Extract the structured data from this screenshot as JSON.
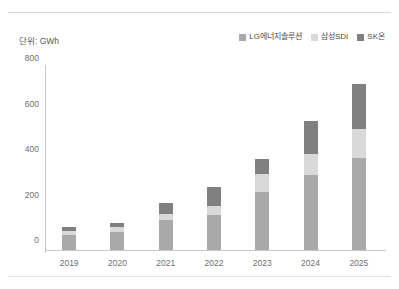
{
  "unit_label": "단위: GWh",
  "legend": {
    "position": "top-right",
    "items": [
      {
        "label": "LG에너지솔루션",
        "color": "#a9a9a9"
      },
      {
        "label": "삼성SDI",
        "color": "#d9d9d9"
      },
      {
        "label": "SK온",
        "color": "#808080"
      }
    ]
  },
  "axis": {
    "y_ticks": [
      "0",
      "200",
      "400",
      "600",
      "800"
    ],
    "x_ticks": [
      "2019",
      "2020",
      "2021",
      "2022",
      "2023",
      "2024",
      "2025"
    ]
  },
  "chart_data": {
    "type": "bar",
    "stacked": true,
    "title": "",
    "subtitle": "",
    "xlabel": "",
    "ylabel": "단위: GWh",
    "ylim": [
      0,
      800
    ],
    "y_ticks": [
      0,
      200,
      400,
      600,
      800
    ],
    "grid": false,
    "legend_position": "top-right",
    "categories": [
      "2019",
      "2020",
      "2021",
      "2022",
      "2023",
      "2024",
      "2025"
    ],
    "series": [
      {
        "name": "LG에너지솔루션",
        "color": "#a9a9a9",
        "values": [
          65,
          80,
          130,
          155,
          255,
          330,
          405
        ]
      },
      {
        "name": "삼성SDI",
        "color": "#d9d9d9",
        "values": [
          20,
          20,
          30,
          40,
          80,
          90,
          125
        ]
      },
      {
        "name": "SK온",
        "color": "#808080",
        "values": [
          15,
          20,
          45,
          80,
          65,
          145,
          200
        ]
      }
    ],
    "totals": [
      100,
      120,
      205,
      275,
      400,
      565,
      730
    ]
  }
}
